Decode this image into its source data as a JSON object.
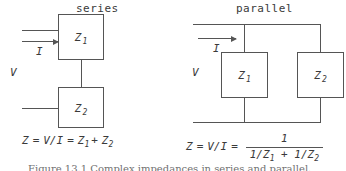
{
  "figure": {
    "caption": "Figure 13.1 Complex impedances in series and parallel.",
    "line_color": "#555555",
    "text_color": "#3a3a3a",
    "background": "#ffffff"
  },
  "series": {
    "heading": "series",
    "voltage_label": "V",
    "current_label": "I",
    "impedance_1": "Z",
    "impedance_1_sub": "1",
    "impedance_2": "Z",
    "impedance_2_sub": "2",
    "equation": {
      "lhs": "Z",
      "eq1": "=",
      "ratio": "V/I",
      "eq2": "=",
      "term1": "Z",
      "term1_sub": "1",
      "plus": "+",
      "term2": "Z",
      "term2_sub": "2"
    }
  },
  "parallel": {
    "heading": "parallel",
    "voltage_label": "V",
    "current_label": "I",
    "impedance_1": "Z",
    "impedance_1_sub": "1",
    "impedance_2": "Z",
    "impedance_2_sub": "2",
    "equation": {
      "lhs": "Z",
      "eq1": "=",
      "ratio": "V/I",
      "eq2": "=",
      "numerator": "1",
      "den_a": "1/Z",
      "den_a_sub": "1",
      "den_plus": "+",
      "den_b": "1/Z",
      "den_b_sub": "2"
    }
  }
}
